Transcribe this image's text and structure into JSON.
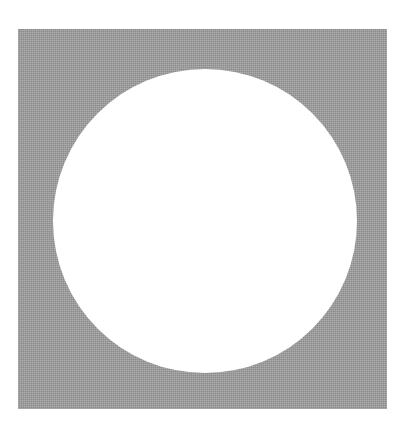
{
  "figure": {
    "canvas": {
      "width": 409,
      "height": 436,
      "background_color": "#ffffff"
    },
    "shapes": [
      {
        "name": "gray-square",
        "type": "square",
        "fill_color": "#9b9b9b",
        "texture": "dithered halftone",
        "x": 18,
        "y": 29,
        "width": 369,
        "height": 380,
        "corner_style": "sharp"
      },
      {
        "name": "white-circle",
        "type": "circle",
        "fill_color": "#ffffff",
        "center_x": 205,
        "center_y": 221,
        "radius": 152,
        "diameter": 304
      }
    ]
  }
}
